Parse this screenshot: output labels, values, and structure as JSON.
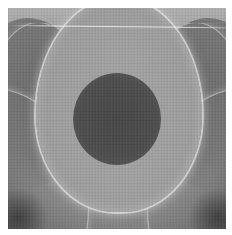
{
  "image": {
    "kind": "grayscale micrograph / interference pattern",
    "features": [
      "central-dark-disc",
      "bright-u-shaped-ring",
      "outer-corner-arcs",
      "top-horizontal-scanline"
    ],
    "colors": {
      "background": "#ffffff",
      "field": "#8c8c8c",
      "center_spot": "#4a4a4a",
      "ring_highlight": "#e0e0e0",
      "corner_dark": "#3e3e3e"
    }
  }
}
